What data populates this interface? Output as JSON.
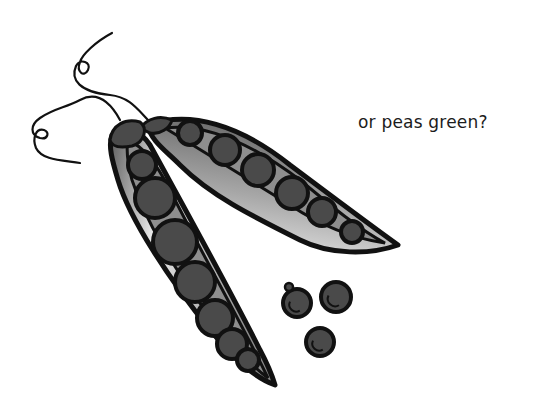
{
  "caption": "or peas green?",
  "illustration": {
    "subject": "pea pods with loose peas",
    "pods": [
      {
        "name": "left-pod",
        "peas_visible": 7
      },
      {
        "name": "right-pod",
        "peas_visible": 6
      }
    ],
    "loose_peas": 3,
    "colors": {
      "outline": "#111111",
      "pea": "#4a4a4a",
      "pea_highlight": "#6a6a6a",
      "pod_light": "#e4e4e4",
      "pod_mid": "#9a9a9a",
      "pod_dark": "#5c5c5c",
      "background": "#ffffff"
    }
  }
}
